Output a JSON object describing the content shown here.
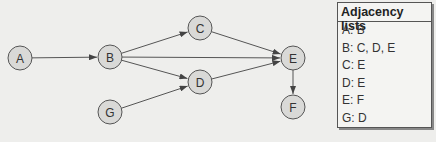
{
  "graph": {
    "nodes": [
      {
        "id": "A",
        "label": "A",
        "x": 20,
        "y": 58
      },
      {
        "id": "B",
        "label": "B",
        "x": 110,
        "y": 57
      },
      {
        "id": "C",
        "label": "C",
        "x": 200,
        "y": 28
      },
      {
        "id": "D",
        "label": "D",
        "x": 200,
        "y": 82
      },
      {
        "id": "G",
        "label": "G",
        "x": 110,
        "y": 112
      },
      {
        "id": "E",
        "label": "E",
        "x": 293,
        "y": 58
      },
      {
        "id": "F",
        "label": "F",
        "x": 293,
        "y": 107
      }
    ],
    "edges": [
      {
        "from": "A",
        "to": "B"
      },
      {
        "from": "B",
        "to": "C"
      },
      {
        "from": "B",
        "to": "D"
      },
      {
        "from": "B",
        "to": "E"
      },
      {
        "from": "C",
        "to": "E"
      },
      {
        "from": "D",
        "to": "E"
      },
      {
        "from": "G",
        "to": "D"
      },
      {
        "from": "E",
        "to": "F"
      }
    ]
  },
  "adjacency": {
    "title": "Adjacency lists",
    "rows": [
      "A: B",
      "B: C, D, E",
      "C: E",
      "D: E",
      "E: F",
      "G: D"
    ]
  }
}
